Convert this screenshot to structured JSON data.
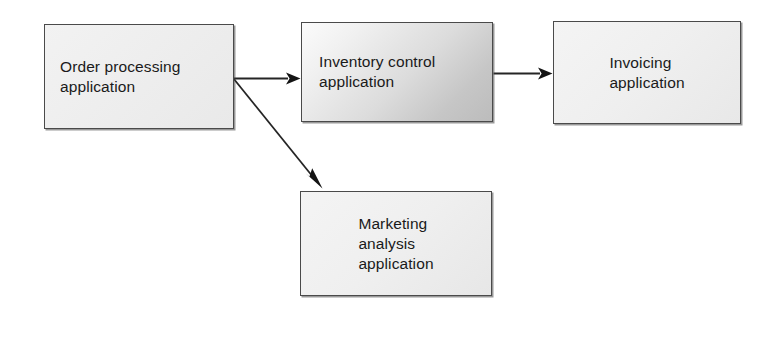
{
  "diagram": {
    "background_color": "#ffffff",
    "nodes": [
      {
        "id": "order-processing",
        "label": "Order processing\napplication",
        "shape": "rectangle",
        "fill": "#eeeeee",
        "border_color": "#4a4a4a",
        "text_align": "left",
        "x": 44,
        "y": 24,
        "width": 190,
        "height": 105
      },
      {
        "id": "inventory-control",
        "label": "Inventory control\napplication",
        "shape": "rectangle",
        "fill": "#dcdcdc",
        "fill_style": "diagonal-gradient",
        "border_color": "#4a4a4a",
        "text_align": "left",
        "highlighted": "true",
        "x": 301,
        "y": 22,
        "width": 192,
        "height": 100
      },
      {
        "id": "invoicing",
        "label": "Invoicing\napplication",
        "shape": "rectangle",
        "fill": "#efefef",
        "border_color": "#4a4a4a",
        "text_align": "center",
        "x": 553,
        "y": 21,
        "width": 188,
        "height": 103
      },
      {
        "id": "marketing-analysis",
        "label": "Marketing\nanalysis\napplication",
        "shape": "rectangle",
        "fill": "#efefef",
        "border_color": "#4a4a4a",
        "text_align": "center",
        "x": 300,
        "y": 191,
        "width": 192,
        "height": 105
      }
    ],
    "connectors": [
      {
        "id": "order-to-inventory",
        "from": "order-processing",
        "to": "inventory-control",
        "style": "solid",
        "arrowhead": "filled-triangle",
        "label": "",
        "color": "#252525"
      },
      {
        "id": "inventory-to-invoicing",
        "from": "inventory-control",
        "to": "invoicing",
        "style": "solid",
        "arrowhead": "filled-triangle",
        "label": "",
        "color": "#252525"
      },
      {
        "id": "order-to-marketing",
        "from": "order-processing",
        "to": "marketing-analysis",
        "style": "solid",
        "arrowhead": "filled-triangle",
        "label": "",
        "color": "#252525"
      }
    ]
  }
}
